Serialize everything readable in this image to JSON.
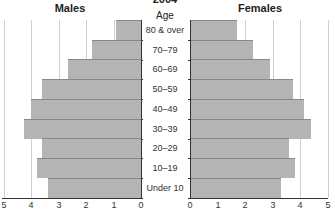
{
  "chart_data": {
    "type": "bar",
    "title": "2004",
    "subtype": "population-pyramid",
    "categories": [
      "80 & over",
      "70–79",
      "60–69",
      "50–59",
      "40–49",
      "30–39",
      "20–29",
      "10–19",
      "Under 10"
    ],
    "category_header": "Age",
    "series": [
      {
        "name": "Males",
        "values": [
          0.9,
          1.8,
          2.65,
          3.6,
          4.0,
          4.25,
          3.6,
          3.8,
          3.4
        ]
      },
      {
        "name": "Females",
        "values": [
          1.7,
          2.3,
          2.9,
          3.75,
          4.15,
          4.4,
          3.6,
          3.8,
          3.3
        ]
      }
    ],
    "xlim": [
      0,
      5
    ],
    "xticks": [
      "5",
      "4",
      "3",
      "2",
      "1",
      "0"
    ],
    "xticks_right": [
      "0",
      "1",
      "2",
      "3",
      "4",
      "5"
    ],
    "grid": true,
    "bar_color": "#b4b4b4"
  },
  "labels": {
    "title": "2004",
    "males": "Males",
    "females": "Females",
    "age": "Age"
  }
}
